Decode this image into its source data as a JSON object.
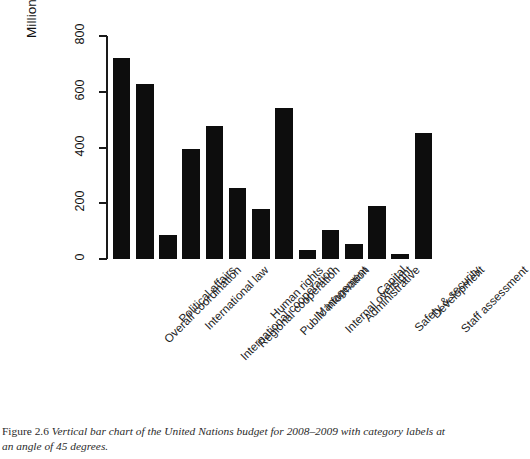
{
  "figure": {
    "caption_number": "Figure 2.6",
    "caption_text": "Vertical bar chart of the United Nations budget for 2008–2009 with category labels at an angle of 45 degrees."
  },
  "chart_data": {
    "type": "bar",
    "title": "",
    "xlabel": "",
    "ylabel": "Millions of US Dollars",
    "ylim": [
      0,
      800
    ],
    "yticks": [
      0,
      200,
      400,
      600,
      800
    ],
    "ytick_labels": [
      "0",
      "200",
      "400",
      "600",
      "800"
    ],
    "grid": false,
    "legend": null,
    "bar_color": "#0d0d0d",
    "label_angle": 45,
    "categories": [
      "Overall coordination",
      "Political affairs",
      "International law",
      "International cooperation",
      "Regional cooperation",
      "Human rights",
      "Public information",
      "Management",
      "Internal oversight",
      "Administrative",
      "Capital",
      "Safety & security",
      "Development",
      "Staff assessment"
    ],
    "values": [
      722,
      628,
      87,
      396,
      477,
      255,
      181,
      540,
      33,
      104,
      53,
      190,
      17,
      452
    ]
  }
}
